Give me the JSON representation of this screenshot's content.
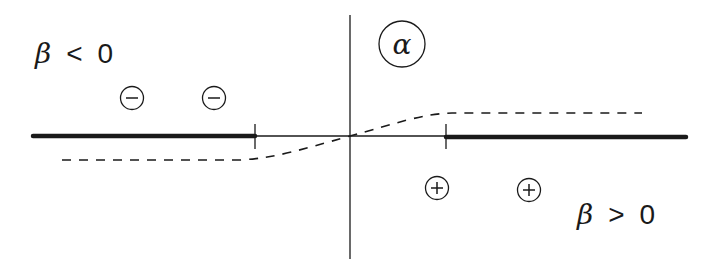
{
  "diagram": {
    "labels": {
      "beta_negative": {
        "greek": "β",
        "relation": "<",
        "value": "0"
      },
      "beta_positive": {
        "greek": "β",
        "relation": ">",
        "value": "0"
      },
      "alpha": "α"
    },
    "charges": {
      "negative": [
        "−",
        "−"
      ],
      "positive": [
        "+",
        "+"
      ]
    },
    "colors": {
      "ink": "#1a1a1a",
      "background": "#ffffff"
    }
  }
}
